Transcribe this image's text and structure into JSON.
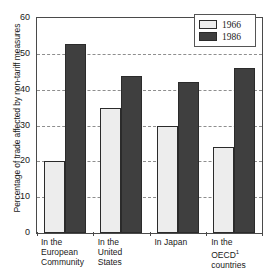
{
  "chart_data": {
    "type": "bar",
    "title": "",
    "xlabel": "",
    "ylabel": "Percentage of trade affected by non-tariff measures",
    "ylim": [
      0,
      60
    ],
    "yticks": [
      0,
      10,
      20,
      30,
      40,
      50,
      60
    ],
    "ytick_labels": [
      "0",
      "10",
      "20",
      "30",
      "40",
      "50",
      "60"
    ],
    "grid": true,
    "grid_style": "dashed-horizontal",
    "legend_position": "top-right",
    "categories": [
      "In the European Community",
      "In the United States",
      "In Japan",
      "In the OECD countries"
    ],
    "category_lines": [
      [
        "In the",
        "European",
        "Community"
      ],
      [
        "In the",
        "United",
        "States"
      ],
      [
        "In Japan"
      ],
      [
        "In the",
        "OECD",
        "countries"
      ]
    ],
    "category_footnote_marker": "1",
    "series": [
      {
        "name": "1966",
        "color": "#ededed",
        "values": [
          20.0,
          35.0,
          29.8,
          24.0
        ]
      },
      {
        "name": "1986",
        "color": "#3f3f3f",
        "values": [
          52.7,
          43.7,
          42.1,
          46.1
        ]
      }
    ],
    "annotations": []
  },
  "legend": {
    "items": [
      {
        "label": "1966",
        "swatch": "light-swatch"
      },
      {
        "label": "1986",
        "swatch": "dark-swatch"
      }
    ]
  },
  "axis": {
    "y_title": "Percentage of trade affected by non-tariff measures"
  }
}
